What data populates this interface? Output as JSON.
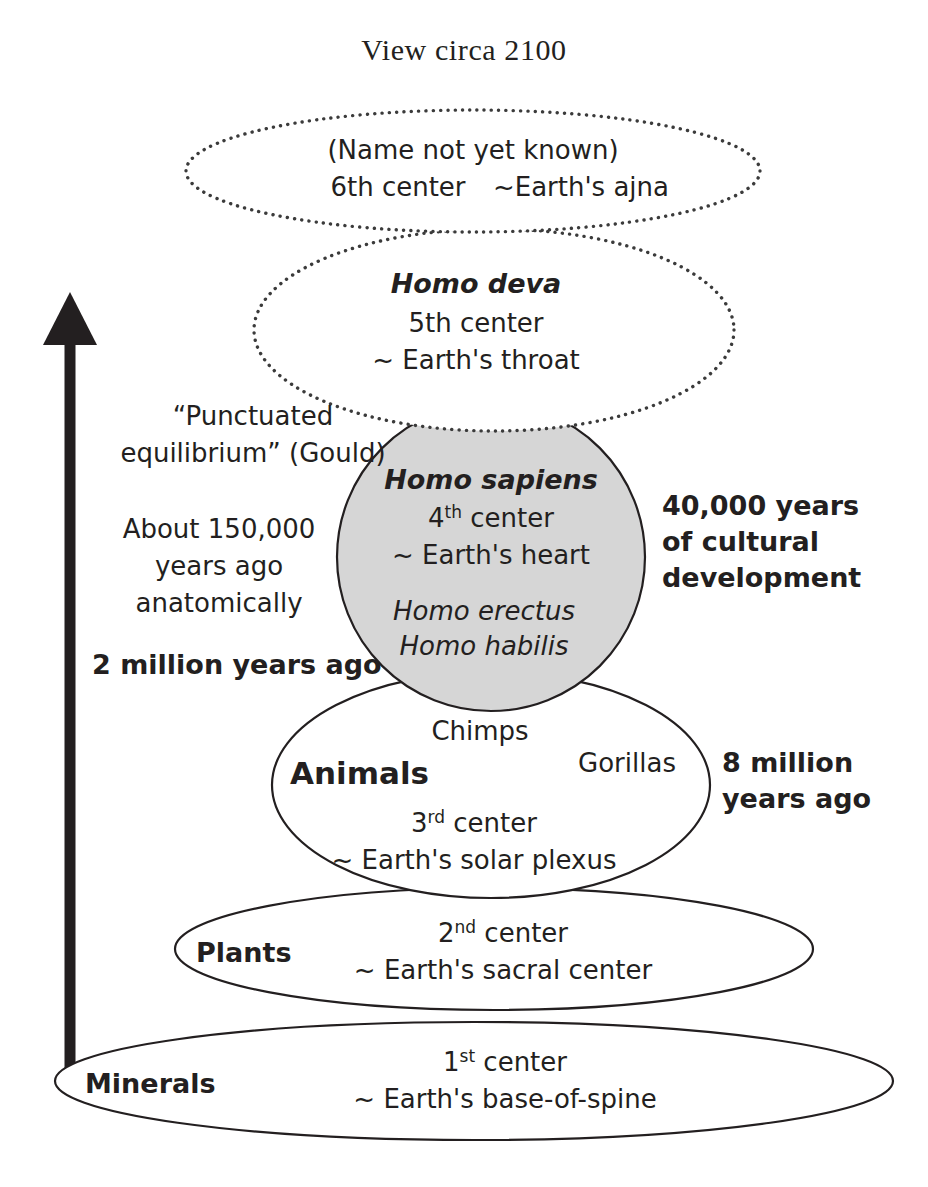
{
  "title": "View circa 2100",
  "diagram": {
    "type": "nested-evolution-ellipses",
    "arrow": {
      "name": "upward-evolution-arrow",
      "direction": "up"
    },
    "levels": [
      {
        "id": "sixth",
        "shape": "ellipse",
        "border": "dotted",
        "fill": "#ffffff",
        "name_label": "(Name not yet known)",
        "center_label": "6th center",
        "earth_label": "~Earth's ajna"
      },
      {
        "id": "fifth",
        "shape": "ellipse",
        "border": "dotted",
        "fill": "#ffffff",
        "name_label": "Homo deva",
        "center_label": "5th center",
        "earth_label": "~ Earth's throat"
      },
      {
        "id": "fourth",
        "shape": "circle",
        "border": "solid",
        "fill": "#d6d6d6",
        "name_label": "Homo sapiens",
        "center_number": "4",
        "center_ordinal": "th",
        "center_label": "center",
        "earth_label": "~ Earth's heart",
        "extra_labels": [
          "Homo erectus",
          "Homo habilis"
        ]
      },
      {
        "id": "third",
        "shape": "ellipse",
        "border": "solid",
        "fill": "#ffffff",
        "name_label": "Animals",
        "center_number": "3",
        "center_ordinal": "rd",
        "center_label": "center",
        "earth_label": "~ Earth's solar plexus",
        "extra_labels": [
          "Chimps",
          "Gorillas"
        ]
      },
      {
        "id": "second",
        "shape": "ellipse",
        "border": "solid",
        "fill": "#ffffff",
        "name_label": "Plants",
        "center_number": "2",
        "center_ordinal": "nd",
        "center_label": "center",
        "earth_label": "~ Earth's sacral center"
      },
      {
        "id": "first",
        "shape": "ellipse",
        "border": "solid",
        "fill": "#ffffff",
        "name_label": "Minerals",
        "center_number": "1",
        "center_ordinal": "st",
        "center_label": "center",
        "earth_label": "~ Earth's base-of-spine"
      }
    ],
    "annotations": {
      "punctuated_line1": "“Punctuated",
      "punctuated_line2": "equilibrium” (Gould)",
      "about_line1": "About 150,000",
      "about_line2": "years ago",
      "about_line3": "anatomically",
      "two_million": "2 million years ago",
      "cultural_line1": "40,000 years",
      "cultural_line2": "of cultural",
      "cultural_line3": "development",
      "eight_million_line1": "8 million",
      "eight_million_line2": "years ago"
    }
  },
  "colors": {
    "ink": "#231f20",
    "gray_fill": "#d6d6d6",
    "page": "#ffffff"
  }
}
